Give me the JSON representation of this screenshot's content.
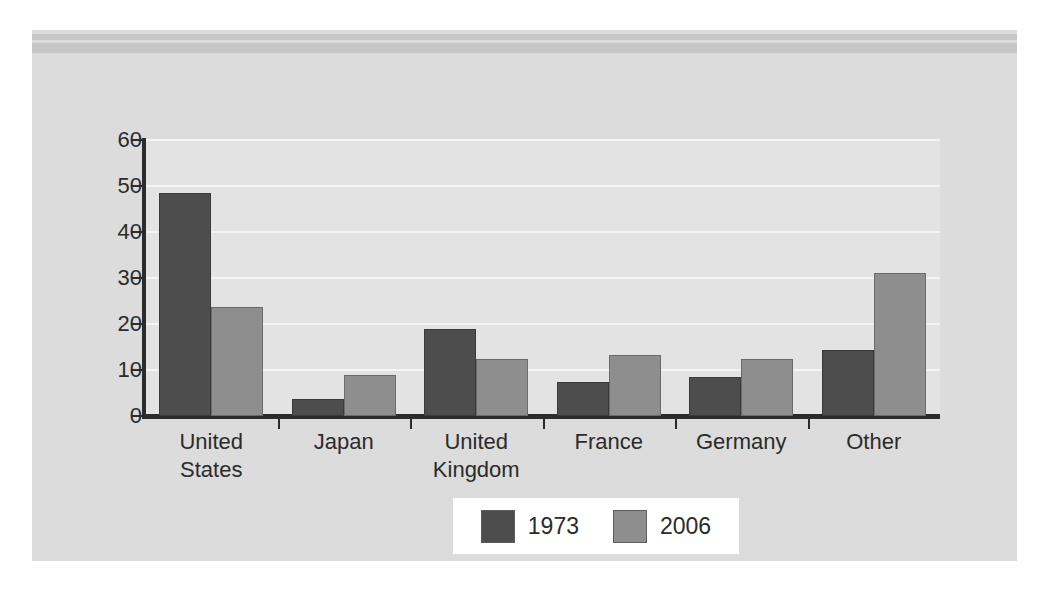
{
  "figure": {
    "background_color": "#dcdcdc",
    "plot_background_color": "#e3e3e3",
    "banner_stripe_color": "#c6c6c6"
  },
  "chart_data": {
    "type": "bar",
    "title": "",
    "subtitle": "",
    "xlabel": "",
    "ylabel": "",
    "ylim": [
      0,
      60
    ],
    "yticks": [
      0,
      10,
      20,
      30,
      40,
      50,
      60
    ],
    "ytick_labels": [
      "0",
      "10",
      "20",
      "30",
      "40",
      "50",
      "60"
    ],
    "grid": true,
    "grid_color": "#f4f4f4",
    "legend_position": "bottom-center",
    "categories": [
      "United\nStates",
      "Japan",
      "United\nKingdom",
      "France",
      "Germany",
      "Other"
    ],
    "series": [
      {
        "name": "1973",
        "color": "#4d4d4d",
        "values": [
          48.4,
          3.6,
          19.0,
          7.3,
          8.5,
          14.3
        ]
      },
      {
        "name": "2006",
        "color": "#8e8e8e",
        "values": [
          23.8,
          9.0,
          12.3,
          13.2,
          12.4,
          31.0
        ]
      }
    ]
  },
  "legend": {
    "items": [
      {
        "label": "1973",
        "color": "#4d4d4d"
      },
      {
        "label": "2006",
        "color": "#8e8e8e"
      }
    ]
  }
}
